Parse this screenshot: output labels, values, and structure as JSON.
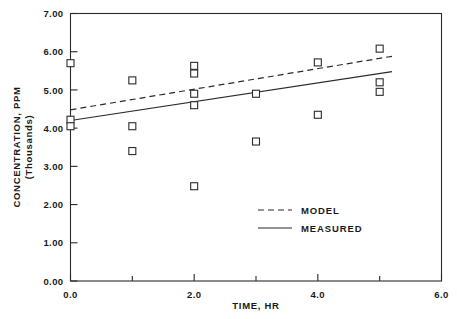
{
  "chart_data": {
    "type": "scatter",
    "title": "",
    "xlabel": "TIME, HR",
    "ylabel_line1": "CONCENTRATION, PPM",
    "ylabel_line2": "(Thousands)",
    "xlim": [
      0.0,
      6.0
    ],
    "ylim": [
      0.0,
      7.0
    ],
    "grid": false,
    "x_ticks_major": [
      0.0,
      2.0,
      4.0,
      6.0
    ],
    "x_tick_labels": [
      "0.0",
      "2.0",
      "4.0",
      "6.0"
    ],
    "x_ticks_minor": [
      1.0,
      3.0,
      5.0
    ],
    "y_ticks_major": [
      0.0,
      1.0,
      2.0,
      3.0,
      4.0,
      5.0,
      6.0,
      7.0
    ],
    "y_tick_labels": [
      "0.00",
      "1.00",
      "2.00",
      "3.00",
      "4.00",
      "5.00",
      "6.00",
      "7.00"
    ],
    "legend_position": "center-right",
    "marker_style": "open-square",
    "series": [
      {
        "name": "MEASURED",
        "type": "scatter",
        "points": [
          {
            "x": 0.0,
            "y": 5.7
          },
          {
            "x": 0.0,
            "y": 4.22
          },
          {
            "x": 0.0,
            "y": 4.05
          },
          {
            "x": 1.0,
            "y": 5.25
          },
          {
            "x": 1.0,
            "y": 4.05
          },
          {
            "x": 1.0,
            "y": 3.4
          },
          {
            "x": 2.0,
            "y": 5.63
          },
          {
            "x": 2.0,
            "y": 5.43
          },
          {
            "x": 2.0,
            "y": 4.9
          },
          {
            "x": 2.0,
            "y": 4.6
          },
          {
            "x": 2.0,
            "y": 2.48
          },
          {
            "x": 3.0,
            "y": 4.9
          },
          {
            "x": 3.0,
            "y": 3.65
          },
          {
            "x": 4.0,
            "y": 5.72
          },
          {
            "x": 4.0,
            "y": 4.35
          },
          {
            "x": 5.0,
            "y": 6.08
          },
          {
            "x": 5.0,
            "y": 5.2
          },
          {
            "x": 5.0,
            "y": 4.95
          }
        ]
      },
      {
        "name": "MODEL",
        "type": "line",
        "style": "dashed",
        "points": [
          {
            "x": 0.0,
            "y": 4.48
          },
          {
            "x": 5.2,
            "y": 5.88
          }
        ]
      },
      {
        "name": "MEASURED",
        "type": "line",
        "style": "solid",
        "points": [
          {
            "x": 0.0,
            "y": 4.2
          },
          {
            "x": 5.2,
            "y": 5.48
          }
        ]
      }
    ],
    "legend": [
      {
        "label": "MODEL",
        "style": "dashed"
      },
      {
        "label": "MEASURED",
        "style": "solid"
      }
    ]
  },
  "colors": {
    "ink": "#2b2b2b",
    "background": "#ffffff",
    "marker_fill": "#ffffff"
  }
}
